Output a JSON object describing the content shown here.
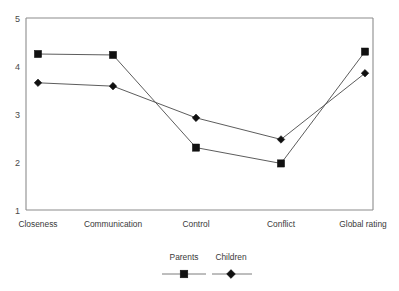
{
  "chart_data": {
    "type": "line",
    "title": "",
    "subtitle": "",
    "xlabel": "",
    "ylabel": "",
    "categories": [
      "Closeness",
      "Communication",
      "Control",
      "Conflict",
      "Global rating"
    ],
    "series": [
      {
        "name": "Parents",
        "marker": "square",
        "values": [
          4.25,
          4.23,
          2.3,
          1.97,
          4.3
        ]
      },
      {
        "name": "Children",
        "marker": "diamond",
        "values": [
          3.65,
          3.58,
          2.92,
          2.47,
          3.85
        ]
      }
    ],
    "ylim": [
      1,
      5
    ],
    "yticks": [
      1,
      2,
      3,
      4,
      5
    ],
    "ytick_labels": [
      "1",
      "2",
      "3",
      "4",
      "5"
    ],
    "grid": false,
    "legend_position": "bottom",
    "legend_entries": [
      {
        "label": "Parents",
        "marker": "square"
      },
      {
        "label": "Children",
        "marker": "diamond"
      }
    ],
    "colors": {
      "series_line": "#4a4a4a",
      "marker": "#111111",
      "axis": "#8c8c8c",
      "text": "#3a3a3a",
      "background": "#ffffff"
    }
  }
}
